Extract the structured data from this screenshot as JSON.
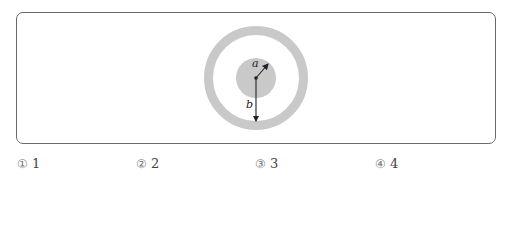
{
  "diagram": {
    "label_a": "a",
    "label_b": "b",
    "colors": {
      "fill": "#c9c9c9",
      "frame": "#6a6a6a",
      "arrow": "#222222"
    }
  },
  "choices": [
    {
      "marker": "①",
      "value": "1"
    },
    {
      "marker": "②",
      "value": "2"
    },
    {
      "marker": "③",
      "value": "3"
    },
    {
      "marker": "④",
      "value": "4"
    }
  ]
}
